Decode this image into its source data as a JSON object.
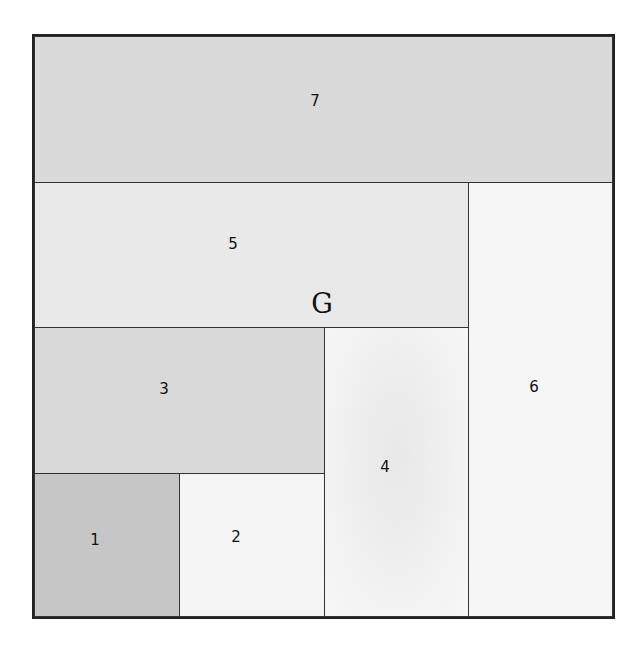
{
  "diagram": {
    "title_letter": "G",
    "regions": [
      {
        "id": "1",
        "label": "1",
        "color": "#c6c6c6"
      },
      {
        "id": "2",
        "label": "2",
        "color": "#f5f5f5"
      },
      {
        "id": "3",
        "label": "3",
        "color": "#d9d9d9"
      },
      {
        "id": "4",
        "label": "4",
        "color": "#efefef"
      },
      {
        "id": "5",
        "label": "5",
        "color": "#e9e9e9"
      },
      {
        "id": "6",
        "label": "6",
        "color": "#f6f6f6"
      },
      {
        "id": "7",
        "label": "7",
        "color": "#dadada"
      }
    ]
  }
}
